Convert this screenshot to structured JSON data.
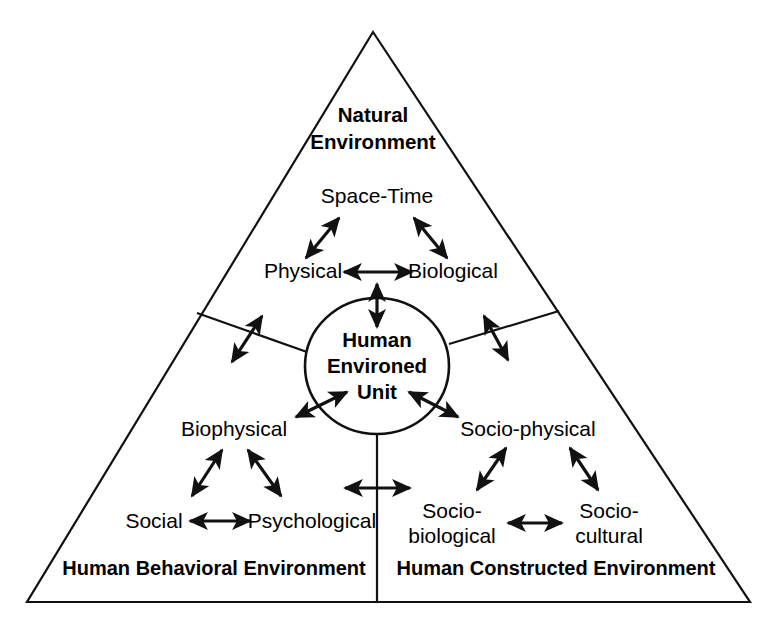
{
  "figure": {
    "shape": "triangle",
    "background_color": "#ffffff",
    "line_color": "#111111"
  },
  "center": {
    "name": "human-environed-unit",
    "lines": [
      "Human",
      "Environed",
      "Unit"
    ]
  },
  "zones": {
    "natural": {
      "title_lines": [
        "Natural",
        "Environment"
      ],
      "nodes": [
        {
          "label": "Space-Time"
        },
        {
          "label": "Physical"
        },
        {
          "label": "Biological"
        }
      ]
    },
    "behavioral": {
      "base_title": "Human Behavioral Environment",
      "nodes": [
        {
          "label": "Biophysical"
        },
        {
          "label": "Social"
        },
        {
          "label": "Psychological"
        }
      ]
    },
    "constructed": {
      "base_title": "Human Constructed Environment",
      "nodes": [
        {
          "label": "Socio-physical"
        },
        {
          "label_line1": "Socio-",
          "label_line2": "biological"
        },
        {
          "label_line1": "Socio-",
          "label_line2": "cultural"
        }
      ]
    }
  },
  "relationships": [
    {
      "from": "Space-Time",
      "to": "Physical",
      "type": "bidirectional"
    },
    {
      "from": "Space-Time",
      "to": "Biological",
      "type": "bidirectional"
    },
    {
      "from": "Physical",
      "to": "Biological",
      "type": "bidirectional"
    },
    {
      "from": "Natural Environment",
      "to": "Human Environed Unit",
      "type": "bidirectional"
    },
    {
      "from": "Human Environed Unit",
      "to": "Biophysical",
      "type": "bidirectional"
    },
    {
      "from": "Biophysical",
      "to": "Social",
      "type": "bidirectional"
    },
    {
      "from": "Biophysical",
      "to": "Psychological",
      "type": "bidirectional"
    },
    {
      "from": "Social",
      "to": "Psychological",
      "type": "bidirectional"
    },
    {
      "from": "Human Environed Unit",
      "to": "Socio-physical",
      "type": "bidirectional"
    },
    {
      "from": "Socio-physical",
      "to": "Socio-biological",
      "type": "bidirectional"
    },
    {
      "from": "Socio-physical",
      "to": "Socio-cultural",
      "type": "bidirectional"
    },
    {
      "from": "Socio-biological",
      "to": "Socio-cultural",
      "type": "bidirectional"
    },
    {
      "from": "Human Behavioral Environment",
      "to": "Human Constructed Environment",
      "type": "bidirectional"
    },
    {
      "from": "Natural Environment",
      "to": "Human Behavioral Environment",
      "type": "bidirectional"
    },
    {
      "from": "Natural Environment",
      "to": "Human Constructed Environment",
      "type": "bidirectional"
    }
  ]
}
